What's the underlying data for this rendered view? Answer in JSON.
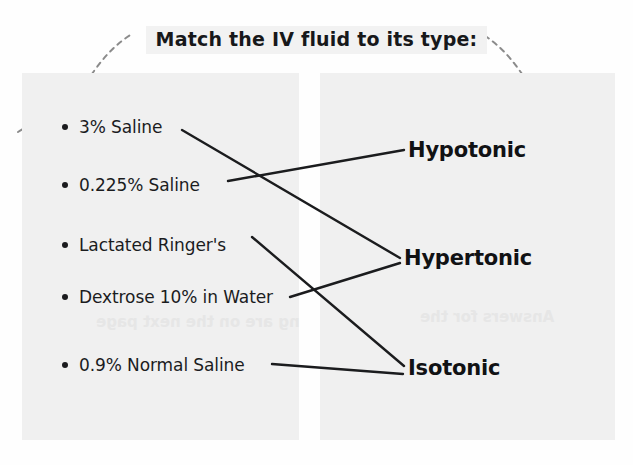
{
  "page": {
    "background_color": "#fefefe",
    "panel_color": "#f0f0f0",
    "ink_color": "#1b1c1e"
  },
  "header": {
    "title": "Match the IV fluid to its type:",
    "title_highlight_color": "#f2f2f2"
  },
  "decorations": {
    "squiggle_left": "dashed-loop-squiggle",
    "squiggle_right": "dashed-loop-squiggle",
    "squiggle_color": "#8b8b8b",
    "ghost_text_left": "ng are on the next page",
    "ghost_text_right": "Answers for the"
  },
  "left_column": {
    "name": "IV fluids",
    "items": [
      {
        "id": "fluid-3-saline",
        "label": "3% Saline",
        "x": 62,
        "y": 117
      },
      {
        "id": "fluid-0225-saline",
        "label": "0.225% Saline",
        "x": 62,
        "y": 175
      },
      {
        "id": "fluid-lactated-ringers",
        "label": "Lactated Ringer's",
        "x": 62,
        "y": 235
      },
      {
        "id": "fluid-dextrose-10",
        "label": "Dextrose 10% in Water",
        "x": 62,
        "y": 287
      },
      {
        "id": "fluid-09-normal-saline",
        "label": "0.9% Normal Saline",
        "x": 62,
        "y": 355
      }
    ]
  },
  "right_column": {
    "name": "Tonicity types",
    "items": [
      {
        "id": "type-hypotonic",
        "label": "Hypotonic",
        "x": 408,
        "y": 138
      },
      {
        "id": "type-hypertonic",
        "label": "Hypertonic",
        "x": 404,
        "y": 246
      },
      {
        "id": "type-isotonic",
        "label": "Isotonic",
        "x": 408,
        "y": 356
      }
    ]
  },
  "connections": [
    {
      "id": "line-3-saline-to-hypertonic",
      "from": "3% Saline",
      "to": "Hypertonic",
      "x1": 182,
      "y1": 130,
      "x2": 400,
      "y2": 258
    },
    {
      "id": "line-0225-to-hypotonic",
      "from": "0.225% Saline",
      "to": "Hypotonic",
      "x1": 228,
      "y1": 181,
      "x2": 404,
      "y2": 150
    },
    {
      "id": "line-ringers-to-isotonic",
      "from": "Lactated Ringer's",
      "to": "Isotonic",
      "x1": 252,
      "y1": 237,
      "x2": 404,
      "y2": 366
    },
    {
      "id": "line-dextrose-to-hypertonic",
      "from": "Dextrose 10% in Water",
      "to": "Hypertonic",
      "x1": 290,
      "y1": 297,
      "x2": 400,
      "y2": 263
    },
    {
      "id": "line-normal-saline-to-isotonic",
      "from": "0.9% Normal Saline",
      "to": "Isotonic",
      "x1": 272,
      "y1": 364,
      "x2": 403,
      "y2": 374
    }
  ],
  "line_style": {
    "color": "#1b1c1e",
    "width": 2.4
  }
}
